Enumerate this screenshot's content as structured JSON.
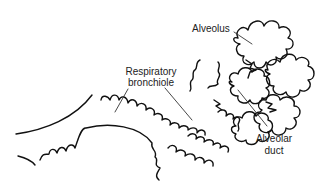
{
  "diagram": {
    "title": "",
    "labels": {
      "alveolus": "Alveolus",
      "respiratory_bronchiole_line1": "Respiratory",
      "respiratory_bronchiole_line2": "bronchiole",
      "alveolar_duct_line1": "Alveolar",
      "alveolar_duct_line2": "duct"
    },
    "colors": {
      "stroke": "#111111",
      "leader": "#333333",
      "background": "#ffffff"
    }
  }
}
